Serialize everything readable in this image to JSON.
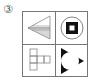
{
  "question_label": "③",
  "figure": {
    "rows": 2,
    "cols": 2,
    "cells": [
      {
        "position": "top-left",
        "shape": "arrowhead-left-triangle",
        "description": "Left-pointing triangle with a horizontal line dividing it; lower half shaded gray"
      },
      {
        "position": "top-right",
        "shape": "circle-with-black-square",
        "description": "Circle containing a black square with a white square center"
      },
      {
        "position": "bottom-left",
        "shape": "cross-of-squares",
        "description": "Outlined squares arranged in a T/cross pattern"
      },
      {
        "position": "bottom-right",
        "shape": "circle-with-black-triangles",
        "description": "White circle surrounded by three black triangle corners"
      }
    ]
  },
  "colors": {
    "line": "#777777",
    "fill_gray": "#d8d8d8",
    "black": "#111111"
  }
}
